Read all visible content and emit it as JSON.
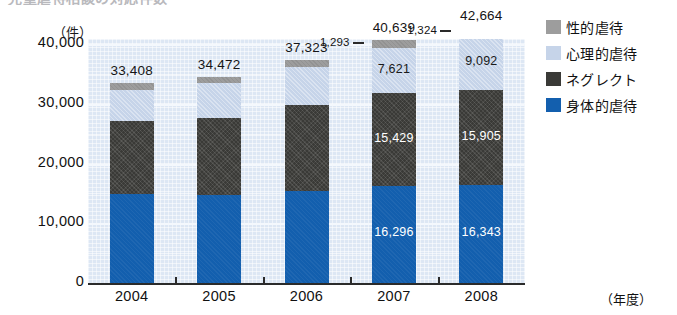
{
  "figure": {
    "clipped_title": "児童虐待相談の対応件数"
  },
  "axes": {
    "y_unit": "（件）",
    "y_ticks": [
      "40,000",
      "30,000",
      "20,000",
      "10,000",
      "0"
    ],
    "x_unit": "（年度）",
    "x_categories": [
      "2004",
      "2005",
      "2006",
      "2007",
      "2008"
    ]
  },
  "legend": {
    "items": [
      {
        "label": "性的虐待",
        "color": "#9d9d9d",
        "key": "sexual"
      },
      {
        "label": "心理的虐待",
        "color": "#c6d4e9",
        "key": "psych"
      },
      {
        "label": "ネグレクト",
        "color": "#3a3a37",
        "key": "neglect"
      },
      {
        "label": "身体的虐待",
        "color": "#135fae",
        "key": "physical"
      }
    ]
  },
  "bars": [
    {
      "year": "2004",
      "total_label": "33,408",
      "callout_label": "",
      "segments": [
        {
          "key": "physical",
          "label": ""
        },
        {
          "key": "neglect",
          "label": ""
        },
        {
          "key": "psych",
          "label": ""
        },
        {
          "key": "sexual",
          "label": ""
        }
      ]
    },
    {
      "year": "2005",
      "total_label": "34,472",
      "callout_label": "",
      "segments": [
        {
          "key": "physical",
          "label": ""
        },
        {
          "key": "neglect",
          "label": ""
        },
        {
          "key": "psych",
          "label": ""
        },
        {
          "key": "sexual",
          "label": ""
        }
      ]
    },
    {
      "year": "2006",
      "total_label": "37,323",
      "callout_label": "",
      "segments": [
        {
          "key": "physical",
          "label": ""
        },
        {
          "key": "neglect",
          "label": ""
        },
        {
          "key": "psych",
          "label": ""
        },
        {
          "key": "sexual",
          "label": ""
        }
      ]
    },
    {
      "year": "2007",
      "total_label": "40,639",
      "callout_label": "1,293",
      "segments": [
        {
          "key": "physical",
          "label": "16,296"
        },
        {
          "key": "neglect",
          "label": "15,429"
        },
        {
          "key": "psych",
          "label": "7,621"
        },
        {
          "key": "sexual",
          "label": ""
        }
      ]
    },
    {
      "year": "2008",
      "total_label": "42,664",
      "callout_label": "1,324",
      "segments": [
        {
          "key": "physical",
          "label": "16,343"
        },
        {
          "key": "neglect",
          "label": "15,905"
        },
        {
          "key": "psych",
          "label": "9,092"
        },
        {
          "key": "sexual",
          "label": ""
        }
      ]
    }
  ],
  "chart_data": {
    "type": "bar",
    "subtype": "stacked-column",
    "title": "児童虐待相談の対応件数",
    "xlabel": "（年度）",
    "ylabel": "（件）",
    "ylim": [
      0,
      44000
    ],
    "y_ticks": [
      0,
      10000,
      20000,
      30000,
      40000
    ],
    "grid": true,
    "legend_position": "right",
    "categories": [
      "2004",
      "2005",
      "2006",
      "2007",
      "2008"
    ],
    "series": [
      {
        "name": "身体的虐待",
        "color": "#135fae",
        "values": [
          14881,
          14712,
          15364,
          16296,
          16343
        ]
      },
      {
        "name": "ネグレクト",
        "color": "#3a3a37",
        "values": [
          12263,
          12911,
          14365,
          15429,
          15905
        ]
      },
      {
        "name": "心理的虐待",
        "color": "#c6d4e9",
        "values": [
          5216,
          5797,
          6414,
          7621,
          9092
        ]
      },
      {
        "name": "性的虐待",
        "color": "#9d9d9d",
        "values": [
          1048,
          1052,
          1180,
          1293,
          1324
        ]
      }
    ],
    "totals": [
      33408,
      34472,
      37323,
      40639,
      42664
    ],
    "total_labels": [
      "33,408",
      "34,472",
      "37,323",
      "40,639",
      "42,664"
    ],
    "annotations": [
      {
        "category": "2007",
        "series": "身体的虐待",
        "text": "16,296"
      },
      {
        "category": "2007",
        "series": "ネグレクト",
        "text": "15,429"
      },
      {
        "category": "2007",
        "series": "心理的虐待",
        "text": "7,621"
      },
      {
        "category": "2007",
        "series": "性的虐待",
        "text": "1,293"
      },
      {
        "category": "2008",
        "series": "身体的虐待",
        "text": "16,343"
      },
      {
        "category": "2008",
        "series": "ネグレクト",
        "text": "15,905"
      },
      {
        "category": "2008",
        "series": "心理的虐待",
        "text": "9,092"
      },
      {
        "category": "2008",
        "series": "性的虐待",
        "text": "1,324"
      }
    ]
  }
}
